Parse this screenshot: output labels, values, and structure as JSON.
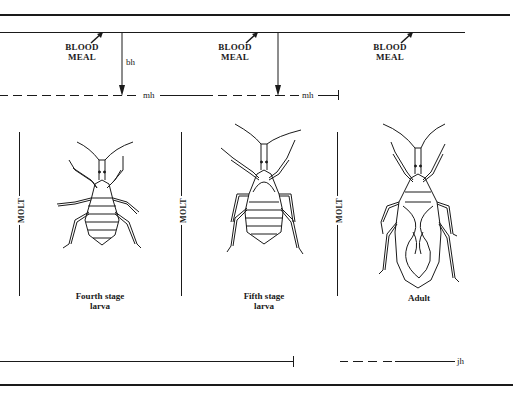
{
  "diagram": {
    "type": "insect-life-cycle-hormone-timeline",
    "colors": {
      "ink": "#1a1a1a",
      "background": "#ffffff"
    },
    "blood_meal_labels": [
      {
        "line1": "BLOOD",
        "line2": "MEAL"
      },
      {
        "line1": "BLOOD",
        "line2": "MEAL"
      },
      {
        "line1": "BLOOD",
        "line2": "MEAL"
      }
    ],
    "hormone_labels": {
      "brain_hormone": "bh",
      "molting_hormone_1": "mh",
      "molting_hormone_2": "mh",
      "juvenile_hormone": "jh"
    },
    "molt_labels": [
      "MOLT",
      "MOLT",
      "MOLT"
    ],
    "stages": [
      {
        "line1": "Fourth stage",
        "line2": "larva"
      },
      {
        "line1": "Fifth stage",
        "line2": "larva"
      },
      {
        "line1": "Adult",
        "line2": ""
      }
    ]
  }
}
